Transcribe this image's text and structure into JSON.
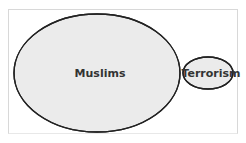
{
  "diagram": {
    "type": "venn",
    "sets": [
      {
        "label": "Muslims",
        "fill": "#ebebeb"
      },
      {
        "label": "Terrorism",
        "fill": "#ebebeb"
      }
    ],
    "overlap_fill": "#c8c8c8",
    "stroke": "#222222"
  }
}
